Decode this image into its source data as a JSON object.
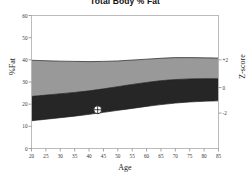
{
  "chart_data": {
    "type": "area",
    "title": "Total Body % Fat",
    "xlabel": "Age",
    "ylabel": "%Fat",
    "y2label": "Z-score",
    "xlim": [
      20,
      85
    ],
    "ylim": [
      0,
      60
    ],
    "xticks": [
      20,
      25,
      30,
      35,
      40,
      45,
      50,
      55,
      60,
      65,
      70,
      75,
      80,
      85
    ],
    "yticks": [
      0,
      10,
      20,
      30,
      40,
      50,
      60
    ],
    "y2ticks": [
      {
        "label": "+2",
        "pct_fat": 40.0
      },
      {
        "label": "0",
        "pct_fat": 27.5
      },
      {
        "label": "-2",
        "pct_fat": 16.0
      }
    ],
    "grid": false,
    "legend": "none",
    "x": [
      20,
      25,
      30,
      35,
      40,
      45,
      50,
      55,
      60,
      65,
      70,
      75,
      80,
      85
    ],
    "series": [
      {
        "name": "+2 Z-score (upper reference)",
        "role": "band_upper",
        "values": [
          39.8,
          39.6,
          39.4,
          39.3,
          39.2,
          39.3,
          39.5,
          39.9,
          40.3,
          40.7,
          41.0,
          41.0,
          40.9,
          40.8
        ]
      },
      {
        "name": "0 Z-score (median)",
        "role": "band_middle",
        "values": [
          23.5,
          24.1,
          24.7,
          25.3,
          26.0,
          26.9,
          27.9,
          28.9,
          29.8,
          30.6,
          31.1,
          31.4,
          31.5,
          31.5
        ]
      },
      {
        "name": "-2 Z-score (lower reference)",
        "role": "band_lower",
        "values": [
          12.5,
          13.2,
          13.9,
          14.6,
          15.4,
          16.3,
          17.2,
          18.1,
          19.0,
          19.8,
          20.5,
          21.0,
          21.3,
          21.5
        ]
      }
    ],
    "bands": [
      {
        "name": "upper-band-0-to-plus2",
        "from": "band_middle",
        "to": "band_upper",
        "color": "#999999"
      },
      {
        "name": "lower-band-minus2-to-0",
        "from": "band_lower",
        "to": "band_middle",
        "color": "#262626"
      }
    ],
    "markers": [
      {
        "name": "patient-measurement",
        "x": 43,
        "y": 17.5,
        "symbol": "circle-crosshair",
        "fill": "#ffffff",
        "stroke": "#1a1a1a"
      }
    ]
  }
}
